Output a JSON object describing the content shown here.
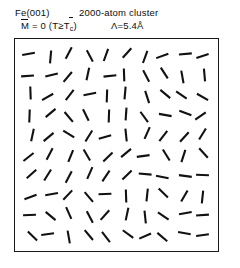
{
  "figure": {
    "title_line1_left": "Fe(001)",
    "title_line1_right": "2000-atom cluster",
    "magnetization_label": "M",
    "magnetization_value": " = 0  (T≥T",
    "magnetization_sub": "c",
    "magnetization_close": ")",
    "lambda_label": "Λ=5.4Å",
    "ink_color": "#111111",
    "background_color": "#ffffff",
    "frame_color": "#1a1a1a"
  },
  "chart_data": {
    "type": "scatter",
    "title": "Fe(001) 2000-atom cluster",
    "subtitle": "M = 0 (T≥Tc), Λ=5.4Å",
    "xlabel": "",
    "ylabel": "",
    "grid": false,
    "legend": "none",
    "xlim": [
      0,
      10
    ],
    "ylim": [
      0,
      10
    ],
    "rows": 10,
    "cols": 10,
    "segment_length_px": 13,
    "segment_width_px": 2.1,
    "angles_deg": [
      [
        10,
        85,
        62,
        118,
        70,
        48,
        70,
        20,
        5,
        18
      ],
      [
        4,
        14,
        50,
        78,
        6,
        92,
        118,
        123,
        100,
        95
      ],
      [
        92,
        30,
        52,
        12,
        88,
        85,
        108,
        140,
        145,
        150
      ],
      [
        88,
        40,
        130,
        116,
        88,
        86,
        126,
        170,
        160,
        35
      ],
      [
        78,
        40,
        148,
        58,
        16,
        96,
        66,
        52,
        48,
        58
      ],
      [
        38,
        62,
        68,
        120,
        44,
        40,
        8,
        122,
        72,
        132
      ],
      [
        42,
        58,
        62,
        66,
        56,
        44,
        175,
        168,
        172,
        178
      ],
      [
        20,
        10,
        46,
        130,
        2,
        92,
        84,
        136,
        60,
        84
      ],
      [
        2,
        140,
        114,
        118,
        48,
        78,
        96,
        146,
        10,
        4
      ],
      [
        136,
        8,
        100,
        130,
        128,
        144,
        24,
        140,
        170,
        8
      ]
    ],
    "jitter_px": [
      [
        [
          -2,
          -1
        ],
        [
          1,
          2
        ],
        [
          0,
          -2
        ],
        [
          2,
          1
        ],
        [
          -1,
          0
        ],
        [
          1,
          -2
        ],
        [
          0,
          2
        ],
        [
          -2,
          1
        ],
        [
          2,
          -1
        ],
        [
          0,
          1
        ]
      ],
      [
        [
          -3,
          1
        ],
        [
          2,
          0
        ],
        [
          -1,
          2
        ],
        [
          0,
          -1
        ],
        [
          3,
          1
        ],
        [
          -2,
          0
        ],
        [
          1,
          1
        ],
        [
          0,
          -2
        ],
        [
          -1,
          2
        ],
        [
          2,
          0
        ]
      ],
      [
        [
          0,
          -2
        ],
        [
          -2,
          2
        ],
        [
          1,
          0
        ],
        [
          2,
          -1
        ],
        [
          0,
          1
        ],
        [
          -1,
          -2
        ],
        [
          2,
          2
        ],
        [
          1,
          -1
        ],
        [
          -2,
          0
        ],
        [
          0,
          2
        ]
      ],
      [
        [
          -1,
          1
        ],
        [
          1,
          -2
        ],
        [
          0,
          2
        ],
        [
          -2,
          0
        ],
        [
          2,
          1
        ],
        [
          0,
          -1
        ],
        [
          -1,
          2
        ],
        [
          1,
          0
        ],
        [
          2,
          -2
        ],
        [
          -2,
          1
        ]
      ],
      [
        [
          2,
          0
        ],
        [
          -1,
          2
        ],
        [
          0,
          -1
        ],
        [
          1,
          1
        ],
        [
          -2,
          2
        ],
        [
          0,
          0
        ],
        [
          2,
          -2
        ],
        [
          -1,
          1
        ],
        [
          1,
          2
        ],
        [
          0,
          -1
        ]
      ],
      [
        [
          -2,
          2
        ],
        [
          0,
          -1
        ],
        [
          2,
          1
        ],
        [
          -1,
          0
        ],
        [
          1,
          2
        ],
        [
          0,
          -2
        ],
        [
          -2,
          1
        ],
        [
          2,
          0
        ],
        [
          0,
          1
        ],
        [
          1,
          -2
        ]
      ],
      [
        [
          1,
          -1
        ],
        [
          -2,
          0
        ],
        [
          0,
          2
        ],
        [
          2,
          -2
        ],
        [
          -1,
          1
        ],
        [
          1,
          0
        ],
        [
          0,
          -1
        ],
        [
          -2,
          2
        ],
        [
          2,
          1
        ],
        [
          0,
          0
        ]
      ],
      [
        [
          0,
          2
        ],
        [
          2,
          -1
        ],
        [
          -1,
          0
        ],
        [
          1,
          2
        ],
        [
          -2,
          -1
        ],
        [
          0,
          1
        ],
        [
          2,
          0
        ],
        [
          -1,
          -2
        ],
        [
          1,
          1
        ],
        [
          0,
          2
        ]
      ],
      [
        [
          -1,
          0
        ],
        [
          1,
          1
        ],
        [
          0,
          -2
        ],
        [
          2,
          2
        ],
        [
          -2,
          0
        ],
        [
          1,
          -1
        ],
        [
          0,
          2
        ],
        [
          -1,
          1
        ],
        [
          2,
          -2
        ],
        [
          0,
          0
        ]
      ],
      [
        [
          2,
          1
        ],
        [
          -2,
          -1
        ],
        [
          0,
          2
        ],
        [
          1,
          0
        ],
        [
          -1,
          2
        ],
        [
          2,
          -1
        ],
        [
          0,
          1
        ],
        [
          -2,
          2
        ],
        [
          1,
          -2
        ],
        [
          0,
          0
        ]
      ]
    ]
  }
}
